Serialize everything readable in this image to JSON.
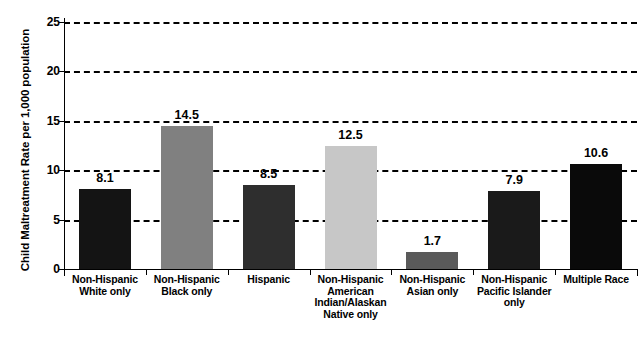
{
  "chart_data": {
    "type": "bar",
    "title": "",
    "subtitle": "",
    "xlabel": "",
    "ylabel": "Child Maltreatment Rate per 1,000 population",
    "ylim": [
      0,
      25
    ],
    "ytick_labels": [
      "0",
      "5",
      "10",
      "15",
      "20",
      "25"
    ],
    "ytick_values": [
      0,
      5,
      10,
      15,
      20,
      25
    ],
    "grid": true,
    "gridlines_at": [
      5,
      10,
      15,
      20,
      25
    ],
    "grid_style": "dashed",
    "legend": "none",
    "categories": [
      "Non-Hispanic\nWhite only",
      "Non-Hispanic\nBlack only",
      "Hispanic",
      "Non-Hispanic\nAmerican\nIndian/Alaskan\nNative only",
      "Non-Hispanic\nAsian only",
      "Non-Hispanic\nPacific Islander\nonly",
      "Multiple Race"
    ],
    "values": [
      8.1,
      14.5,
      8.5,
      12.5,
      1.7,
      7.9,
      10.6
    ],
    "value_labels": [
      "8.1",
      "14.5",
      "8.5",
      "12.5",
      "1.7",
      "7.9",
      "10.6"
    ],
    "bar_colors": [
      "#141414",
      "#808080",
      "#2e2e2e",
      "#c7c7c7",
      "#5a5a5a",
      "#1a1a1a",
      "#0a0a0a"
    ]
  },
  "bars": [
    {
      "label_lines": [
        "Non-Hispanic",
        "White only"
      ],
      "value_label": "8.1",
      "value": 8.1,
      "color": "#141414"
    },
    {
      "label_lines": [
        "Non-Hispanic",
        "Black only"
      ],
      "value_label": "14.5",
      "value": 14.5,
      "color": "#808080"
    },
    {
      "label_lines": [
        "Hispanic"
      ],
      "value_label": "8.5",
      "value": 8.5,
      "color": "#2e2e2e"
    },
    {
      "label_lines": [
        "Non-Hispanic",
        "American",
        "Indian/Alaskan",
        "Native only"
      ],
      "value_label": "12.5",
      "value": 12.5,
      "color": "#c7c7c7"
    },
    {
      "label_lines": [
        "Non-Hispanic",
        "Asian only"
      ],
      "value_label": "1.7",
      "value": 1.7,
      "color": "#5a5a5a"
    },
    {
      "label_lines": [
        "Non-Hispanic",
        "Pacific Islander",
        "only"
      ],
      "value_label": "7.9",
      "value": 7.9,
      "color": "#1a1a1a"
    },
    {
      "label_lines": [
        "Multiple Race"
      ],
      "value_label": "10.6",
      "value": 10.6,
      "color": "#0a0a0a"
    }
  ],
  "axes": {
    "y_title": "Child Maltreatment Rate per 1,000 population",
    "y_ticks": [
      {
        "label": "25",
        "value": 25
      },
      {
        "label": "20",
        "value": 20
      },
      {
        "label": "15",
        "value": 15
      },
      {
        "label": "10",
        "value": 10
      },
      {
        "label": "5",
        "value": 5
      },
      {
        "label": "0",
        "value": 0
      }
    ]
  }
}
